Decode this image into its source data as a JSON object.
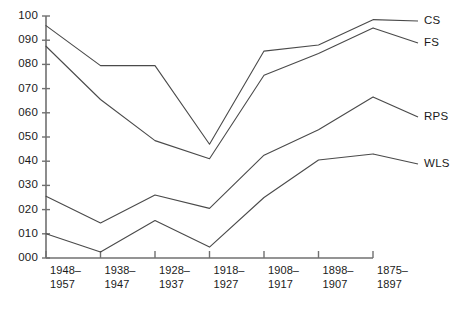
{
  "chart_data": {
    "type": "line",
    "title": "",
    "xlabel": "",
    "ylabel": "",
    "categories": [
      "1948–1957",
      "1938–1947",
      "1928–1937",
      "1918–1927",
      "1908–1917",
      "1898–1907",
      "1875–1897"
    ],
    "category_lines": [
      [
        "1948–",
        "1957"
      ],
      [
        "1938–",
        "1947"
      ],
      [
        "1928–",
        "1937"
      ],
      [
        "1918–",
        "1927"
      ],
      [
        "1908–",
        "1917"
      ],
      [
        "1898–",
        "1907"
      ],
      [
        "1875–",
        "1897"
      ]
    ],
    "ylim": [
      0,
      100
    ],
    "yticks": [
      0,
      10,
      20,
      30,
      40,
      50,
      60,
      70,
      80,
      90,
      100
    ],
    "ytick_labels": [
      "000",
      "010",
      "020",
      "030",
      "040",
      "050",
      "060",
      "070",
      "080",
      "090",
      "100"
    ],
    "grid": false,
    "legend_position": "right-inline",
    "series": [
      {
        "name": "CS",
        "label": "CS",
        "color": "#4a4a4a",
        "values": [
          96,
          79.5,
          79.5,
          47,
          85.5,
          88,
          98.5
        ]
      },
      {
        "name": "FS",
        "label": "FS",
        "color": "#4a4a4a",
        "values": [
          87.5,
          65.5,
          48.5,
          41,
          75.5,
          84.5,
          95
        ]
      },
      {
        "name": "RPS",
        "label": "RPS",
        "color": "#4a4a4a",
        "values": [
          25.5,
          14.5,
          26,
          20.5,
          42.5,
          53,
          66.5
        ]
      },
      {
        "name": "WLS",
        "label": "WLS",
        "color": "#4a4a4a",
        "values": [
          10,
          2.5,
          15.5,
          4.5,
          25,
          40.5,
          43
        ]
      }
    ]
  },
  "axis": {
    "axis_color": "#707070",
    "line_color": "#4a4a4a"
  },
  "caption": {
    "truncated_text": ""
  }
}
